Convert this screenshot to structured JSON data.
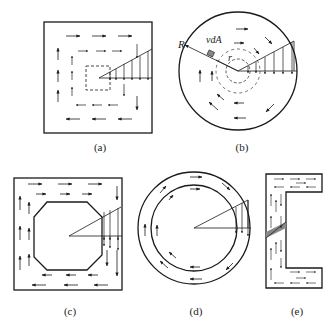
{
  "figure": {
    "panels": [
      {
        "id": "a",
        "label": "(a)",
        "shape": "solid square section",
        "box": [
          44,
          22,
          152,
          133
        ]
      },
      {
        "id": "b",
        "label": "(b)",
        "shape": "solid circular section",
        "center": [
          238,
          71
        ],
        "radius": 59,
        "symbols": {
          "outer_radius": "R",
          "radius": "r",
          "element": "vdA"
        }
      },
      {
        "id": "c",
        "label": "(c)",
        "shape": "square tube with octagonal hole",
        "box": [
          14,
          178,
          122,
          290
        ]
      },
      {
        "id": "d",
        "label": "(d)",
        "shape": "thin-walled annular tube",
        "center": [
          194,
          228
        ],
        "outer_radius": 56,
        "inner_radius": 43
      },
      {
        "id": "e",
        "label": "(e)",
        "shape": "open channel (C) section",
        "box": [
          266,
          174,
          322,
          288
        ]
      }
    ]
  },
  "labels": {
    "a": "(a)",
    "b": "(b)",
    "c": "(c)",
    "d": "(d)",
    "e": "(e)",
    "R": "R",
    "r": "r",
    "vdA": "vdA"
  },
  "colors": {
    "stroke": "#1a1a1a",
    "background": "#ffffff",
    "shade": "#888888"
  }
}
